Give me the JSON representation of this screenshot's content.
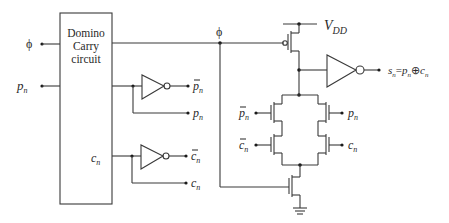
{
  "diagram": {
    "block": {
      "label_lines": [
        "Domino",
        "Carry",
        "circuit"
      ],
      "inner_output_label": "c",
      "inner_output_sub": "n"
    },
    "inputs": {
      "phi": "ϕ",
      "pn": "p",
      "pn_sub": "n"
    },
    "phi_node_label": "ϕ",
    "inverter_outputs": {
      "pn_bar": "p",
      "pn_bar_sub": "n",
      "pn": "p",
      "pn_sub": "n",
      "cn_bar": "c",
      "cn_bar_sub": "n",
      "cn": "c",
      "cn_sub": "n"
    },
    "supply": {
      "vdd": "V",
      "vdd_sub": "DD"
    },
    "output": {
      "s": "s",
      "s_sub": "n",
      "eq": "=",
      "p": "p",
      "p_sub": "n",
      "xor": "⊕",
      "c": "c",
      "c_sub": "n"
    },
    "network_gates": {
      "left_top": "p",
      "left_top_sub": "n",
      "left_bottom": "c",
      "left_bottom_sub": "n",
      "right_top": "p",
      "right_top_sub": "n",
      "right_bottom": "c",
      "right_bottom_sub": "n"
    }
  }
}
